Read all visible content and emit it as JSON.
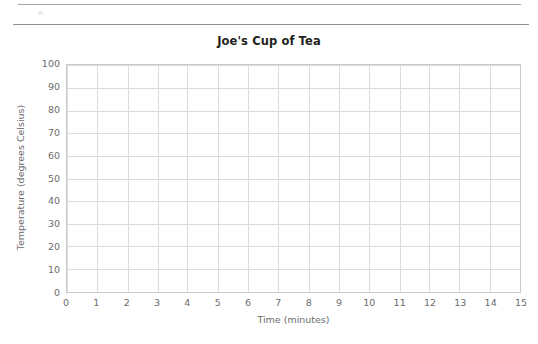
{
  "document": {
    "rules": [
      {
        "name": "upper-rule"
      },
      {
        "name": "lower-rule"
      }
    ],
    "artifact_label": ""
  },
  "chart_data": {
    "type": "line",
    "title": "Joe's Cup of Tea",
    "xlabel": "Time (minutes)",
    "ylabel": "Temperature (degrees Celsius)",
    "xlim": [
      0,
      15
    ],
    "ylim": [
      0,
      100
    ],
    "x_ticks": [
      0,
      1,
      2,
      3,
      4,
      5,
      6,
      7,
      8,
      9,
      10,
      11,
      12,
      13,
      14,
      15
    ],
    "y_ticks": [
      0,
      10,
      20,
      30,
      40,
      50,
      60,
      70,
      80,
      90,
      100
    ],
    "x_tick_labels": [
      "0",
      "1",
      "2",
      "3",
      "4",
      "5",
      "6",
      "7",
      "8",
      "9",
      "10",
      "11",
      "12",
      "13",
      "14",
      "15"
    ],
    "y_tick_labels": [
      "0",
      "10",
      "20",
      "30",
      "40",
      "50",
      "60",
      "70",
      "80",
      "90",
      "100"
    ],
    "grid": true,
    "legend": null,
    "series": [],
    "values": [],
    "annotations": [],
    "note": "Blank worksheet grid — no data plotted"
  },
  "style": {
    "grid_color": "#dcdcdc",
    "plot_border_color": "#c9c9c9",
    "tick_label_color": "#6c6c6c",
    "axis_title_color": "#6c6c6c",
    "title_color": "#231f20",
    "rule_color": "#9a9a9a",
    "background": "#ffffff"
  }
}
